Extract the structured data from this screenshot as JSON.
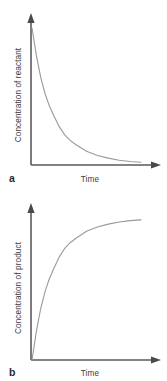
{
  "figure": {
    "background_color": "#ffffff",
    "axis_color": "#5a5a5a",
    "curve_color": "#9a9a9a",
    "text_color": "#3c3c3c"
  },
  "panels": [
    {
      "letter": "a",
      "ylabel": "Concentration of reactant",
      "xlabel": "Time"
    },
    {
      "letter": "b",
      "ylabel": "Concentration of product",
      "xlabel": "Time"
    }
  ],
  "chart_data": [
    {
      "type": "line",
      "title": "",
      "xlabel": "Time",
      "ylabel": "Concentration of reactant",
      "panel_label": "a",
      "grid": false,
      "legend": "none",
      "xlim": [
        0,
        1
      ],
      "ylim": [
        0,
        1
      ],
      "x_ticks": [],
      "y_ticks": [],
      "description": "Exponential decay curve starting at maximum concentration and decreasing asymptotically toward zero.",
      "series": [
        {
          "name": "reactant",
          "x": [
            0.0,
            0.04,
            0.08,
            0.12,
            0.16,
            0.2,
            0.25,
            0.3,
            0.35,
            0.4,
            0.5,
            0.6,
            0.7,
            0.8,
            0.9,
            1.0
          ],
          "values": [
            1.0,
            0.8,
            0.64,
            0.52,
            0.43,
            0.36,
            0.28,
            0.22,
            0.18,
            0.15,
            0.1,
            0.07,
            0.05,
            0.035,
            0.025,
            0.02
          ]
        }
      ]
    },
    {
      "type": "line",
      "title": "",
      "xlabel": "Time",
      "ylabel": "Concentration of product",
      "panel_label": "b",
      "grid": false,
      "legend": "none",
      "xlim": [
        0,
        1
      ],
      "ylim": [
        0,
        1
      ],
      "x_ticks": [],
      "y_ticks": [],
      "description": "Exponential rise curve starting at zero and increasing asymptotically toward a plateau.",
      "series": [
        {
          "name": "product",
          "x": [
            0.0,
            0.04,
            0.08,
            0.12,
            0.16,
            0.2,
            0.25,
            0.3,
            0.35,
            0.4,
            0.5,
            0.6,
            0.7,
            0.8,
            0.9,
            1.0
          ],
          "values": [
            0.0,
            0.2,
            0.36,
            0.48,
            0.57,
            0.64,
            0.72,
            0.78,
            0.82,
            0.85,
            0.9,
            0.93,
            0.95,
            0.965,
            0.975,
            0.98
          ]
        }
      ]
    }
  ]
}
